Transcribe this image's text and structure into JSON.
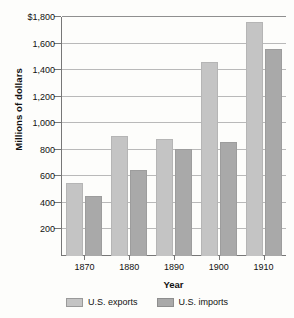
{
  "chart_data": {
    "type": "bar",
    "title": "",
    "xlabel": "Year",
    "ylabel": "Millions of dollars",
    "categories": [
      "1870",
      "1880",
      "1890",
      "1900",
      "1910"
    ],
    "series": [
      {
        "name": "U.S. exports",
        "color": "#c4c4c4",
        "values": [
          550,
          905,
          885,
          1460,
          1765
        ]
      },
      {
        "name": "U.S. imports",
        "color": "#a9a9a9",
        "values": [
          450,
          650,
          805,
          855,
          1560
        ]
      }
    ],
    "ylim": [
      0,
      1800
    ],
    "ytick_values": [
      1800,
      1600,
      1400,
      1200,
      1000,
      800,
      600,
      400,
      200
    ],
    "ytick_labels": [
      "$1,800",
      "1,600",
      "1,400",
      "1,200",
      "1,000",
      "800",
      "600",
      "400",
      "200"
    ],
    "grid": true,
    "legend_position": "bottom"
  },
  "legend": {
    "items": [
      {
        "label": "U.S. exports"
      },
      {
        "label": "U.S. imports"
      }
    ]
  }
}
